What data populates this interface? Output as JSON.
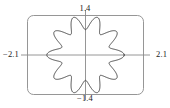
{
  "chart_data": {
    "type": "line",
    "title": "",
    "subtitle": "",
    "xlabel": "",
    "ylabel": "",
    "grid": false,
    "legend": false,
    "legend_position": "none",
    "coordinate_system": "polar",
    "curve_description": "ten-petal polar rose curve centered at origin",
    "petal_count": 10,
    "r_max": 1.4,
    "r_min": 0.9,
    "polar_equation": "r = 1.15 + 0.25*cos(10*theta)",
    "xlim": [
      -2.1,
      2.1
    ],
    "ylim": [
      -1.4,
      1.4
    ],
    "axis_labels": {
      "top": "1.4",
      "bottom": "−1.4",
      "left": "−2.1",
      "right": "2.1"
    },
    "tick_labels": [
      "−2.1",
      "2.1",
      "1.4",
      "−1.4"
    ],
    "series": [
      {
        "name": "polar-rose",
        "theta_deg": [
          0,
          9,
          18,
          27,
          36,
          45,
          54,
          63,
          72,
          81,
          90,
          99,
          108,
          117,
          126,
          135,
          144,
          153,
          162,
          171,
          180,
          189,
          198,
          207,
          216,
          225,
          234,
          243,
          252,
          261,
          270,
          279,
          288,
          297,
          306,
          315,
          324,
          333,
          342,
          351,
          360
        ],
        "r": [
          1.4,
          1.15,
          0.9,
          1.15,
          1.4,
          1.15,
          0.9,
          1.15,
          1.4,
          1.15,
          0.9,
          1.15,
          1.4,
          1.15,
          0.9,
          1.15,
          1.4,
          1.15,
          0.9,
          1.15,
          1.4,
          1.15,
          0.9,
          1.15,
          1.4,
          1.15,
          0.9,
          1.15,
          1.4,
          1.15,
          0.9,
          1.15,
          1.4,
          1.15,
          0.9,
          1.15,
          1.4,
          1.15,
          0.9,
          1.15,
          1.4
        ]
      }
    ],
    "colors": {
      "curve": "#3a3a3a",
      "frame": "#8a8a8a",
      "axis": "#8a8a8a",
      "label": "#1a1a1a",
      "background": "#ffffff"
    },
    "frame": {
      "shape": "rounded-rectangle",
      "corner_radius": 6
    }
  }
}
